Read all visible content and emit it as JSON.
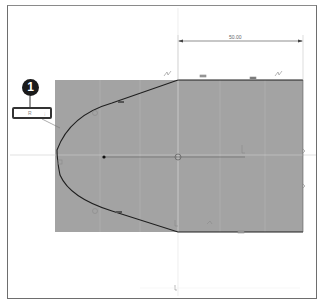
{
  "canvas": {
    "background": "#ffffff",
    "profile_fill": "#a3a3a3",
    "line_color": "#1e1e1e"
  },
  "dimension": {
    "horizontal_value": "50.00"
  },
  "callout": {
    "number": "1"
  },
  "dimension_input": {
    "value": "R",
    "caret": "⁝"
  },
  "constraints": {
    "icons": [
      "tangent-icon",
      "horizontal-icon",
      "coincident-icon",
      "midpoint-icon",
      "fix-icon"
    ]
  }
}
